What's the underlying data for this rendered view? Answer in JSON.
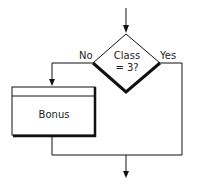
{
  "diagram": {
    "type": "flowchart",
    "decision": {
      "text_line1": "Class",
      "text_line2": "= 3?"
    },
    "branches": {
      "no_label": "No",
      "yes_label": "Yes"
    },
    "process": {
      "label": "Bonus"
    },
    "colors": {
      "stroke": "#111111",
      "background": "#ffffff"
    }
  }
}
